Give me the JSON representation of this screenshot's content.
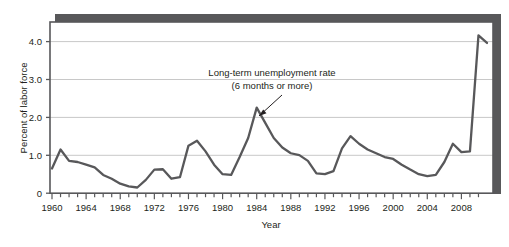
{
  "chart_data": {
    "type": "line",
    "title": "",
    "subtitle": "",
    "xlabel": "Year",
    "ylabel": "Percent of labor force",
    "xlim": [
      1960,
      2011
    ],
    "ylim": [
      0,
      4.5
    ],
    "grid": "horizontal",
    "legend_position": "none",
    "series_color": "#58585a",
    "frame_shadow_color": "#58585a",
    "gridline_color": "#c8c8c8",
    "axis_color": "#58585a",
    "y_ticks": [
      "0",
      "1.0",
      "2.0",
      "3.0",
      "4.0"
    ],
    "y_tick_values": [
      0,
      1,
      2,
      3,
      4
    ],
    "x_ticks": [
      "1960",
      "1964",
      "1968",
      "1972",
      "1976",
      "1980",
      "1984",
      "1988",
      "1992",
      "1996",
      "2000",
      "2004",
      "2008"
    ],
    "x_tick_values": [
      1960,
      1964,
      1968,
      1972,
      1976,
      1980,
      1984,
      1988,
      1992,
      1996,
      2000,
      2004,
      2008
    ],
    "x_minor_tick_interval": 1,
    "annotations": [
      {
        "name": "series-callout",
        "line1": "Long-term unemployment rate",
        "line2": "(6 months or more)",
        "points_to_x": 1983,
        "points_to_y": 2.1
      }
    ],
    "series": [
      {
        "name": "Long-term unemployment rate (6 months or more)",
        "x": [
          1960,
          1961,
          1962,
          1963,
          1964,
          1965,
          1966,
          1967,
          1968,
          1969,
          1970,
          1971,
          1972,
          1973,
          1974,
          1975,
          1976,
          1977,
          1978,
          1979,
          1980,
          1981,
          1982,
          1983,
          1984,
          1985,
          1986,
          1987,
          1988,
          1989,
          1990,
          1991,
          1992,
          1993,
          1994,
          1995,
          1996,
          1997,
          1998,
          1999,
          2000,
          2001,
          2002,
          2003,
          2004,
          2005,
          2006,
          2007,
          2008,
          2009,
          2010
        ],
        "values": [
          0.65,
          1.15,
          0.85,
          0.82,
          0.75,
          0.68,
          0.48,
          0.38,
          0.25,
          0.18,
          0.15,
          0.35,
          0.62,
          0.63,
          0.38,
          0.42,
          1.25,
          1.38,
          1.1,
          0.75,
          0.5,
          0.48,
          0.95,
          1.45,
          2.25,
          1.85,
          1.45,
          1.2,
          1.05,
          1.0,
          0.85,
          0.52,
          0.5,
          0.58,
          1.18,
          1.5,
          1.3,
          1.15,
          1.05,
          0.95,
          0.9,
          0.75,
          0.62,
          0.5,
          0.45,
          0.48,
          0.82,
          1.3,
          1.08,
          0.82,
          0.8
        ]
      }
    ],
    "series_extension": {
      "note": "curve continues past 2008 tick to right frame edge",
      "x": [
        2008,
        2009,
        2010,
        2011
      ],
      "values": [
        0.8,
        1.1,
        4.15,
        3.95
      ]
    }
  }
}
